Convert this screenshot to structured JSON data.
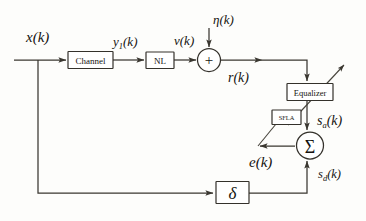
{
  "figure": {
    "type": "block-diagram",
    "background_color": "#fdfdfb",
    "line_color": "#3a3730"
  },
  "blocks": [
    {
      "id": "channel",
      "label": "Channel",
      "shape": "rect"
    },
    {
      "id": "nl",
      "label": "NL",
      "shape": "rect"
    },
    {
      "id": "adder",
      "label": "+",
      "shape": "circle"
    },
    {
      "id": "equalizer",
      "label": "Equalizer",
      "shape": "rect"
    },
    {
      "id": "sfla",
      "label": "SFLA",
      "shape": "rect"
    },
    {
      "id": "summer",
      "label": "Σ",
      "shape": "circle"
    },
    {
      "id": "delta",
      "label": "δ",
      "shape": "rect"
    }
  ],
  "signals": {
    "input": {
      "base": "x",
      "sub": "",
      "arg": "(k)"
    },
    "channel_out": {
      "base": "y",
      "sub": "1",
      "arg": "(k)"
    },
    "nl_out": {
      "base": "v",
      "sub": "",
      "arg": "(k)"
    },
    "noise": {
      "base": "η",
      "sub": "",
      "arg": "(k)"
    },
    "received": {
      "base": "r",
      "sub": "",
      "arg": "(k)"
    },
    "equalized": {
      "base": "s",
      "sub": "a",
      "arg": "(k)"
    },
    "desired": {
      "base": "s",
      "sub": "d",
      "arg": "(k)"
    },
    "error": {
      "base": "e",
      "sub": "",
      "arg": "(k)"
    }
  }
}
